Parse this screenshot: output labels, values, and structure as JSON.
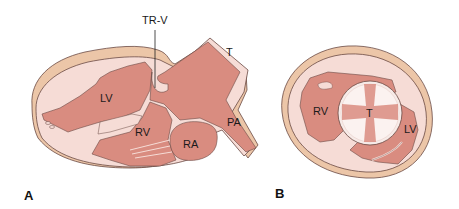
{
  "panels": [
    {
      "id": "A",
      "label": "A",
      "description": "Long-axis section of heart",
      "structures": [
        {
          "abbr": "TR-V",
          "name": "tricuspid valve region / leader line"
        },
        {
          "abbr": "T",
          "name": "truncus / outflow tract"
        },
        {
          "abbr": "LV",
          "name": "left ventricle"
        },
        {
          "abbr": "RV",
          "name": "right ventricle"
        },
        {
          "abbr": "RA",
          "name": "right atrium"
        },
        {
          "abbr": "PA",
          "name": "pulmonary artery"
        }
      ]
    },
    {
      "id": "B",
      "label": "B",
      "description": "Short-axis cross section",
      "structures": [
        {
          "abbr": "RV",
          "name": "right ventricle"
        },
        {
          "abbr": "T",
          "name": "truncal valve"
        },
        {
          "abbr": "LV",
          "name": "left ventricle"
        }
      ]
    }
  ],
  "labels": {
    "a_trv": "TR-V",
    "a_t": "T",
    "a_lv": "LV",
    "a_rv": "RV",
    "a_ra": "RA",
    "a_pa": "PA",
    "a_panel": "A",
    "b_rv": "RV",
    "b_t": "T",
    "b_lv": "LV",
    "b_panel": "B"
  },
  "colors": {
    "chamber": "#d98c80",
    "chamber_dark": "#c97467",
    "wall": "#f6dcd6",
    "epicardium": "#ecc6a8",
    "outline": "#6b4a44",
    "background": "#ffffff"
  }
}
